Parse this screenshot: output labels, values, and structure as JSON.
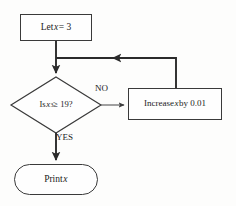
{
  "diagram": {
    "type": "flowchart",
    "background_color": "#fdfdfc",
    "line_color": "#2b2b2b",
    "secondary_line_color": "#6e6e6e",
    "text_color": "#1b1b1b",
    "nodes": [
      {
        "id": "let",
        "shape": "process",
        "text": "Let x = 3",
        "text_prefix": "Let ",
        "variable": "x",
        "text_suffix": " = 3"
      },
      {
        "id": "test",
        "shape": "decision",
        "text": "Is x³ ≥ 19?",
        "text_prefix": "Is ",
        "variable": "x",
        "exponent": "3",
        "text_suffix": " ≥ 19?"
      },
      {
        "id": "increase",
        "shape": "process",
        "text": "Increase x by 0.01",
        "text_prefix": "Increase ",
        "variable": "x",
        "text_suffix": " by 0.01"
      },
      {
        "id": "print",
        "shape": "terminator",
        "text": "Print x",
        "text_prefix": "Print ",
        "variable": "x",
        "text_suffix": ""
      }
    ],
    "edges": [
      {
        "id": "no-branch",
        "label": "NO",
        "from": "test",
        "to": "increase"
      },
      {
        "id": "yes-branch",
        "label": "YES",
        "from": "test",
        "to": "print"
      },
      {
        "id": "feedback",
        "label": "",
        "from": "increase",
        "to": "test"
      },
      {
        "id": "start-edge",
        "label": "",
        "from": "let",
        "to": "test"
      }
    ]
  }
}
